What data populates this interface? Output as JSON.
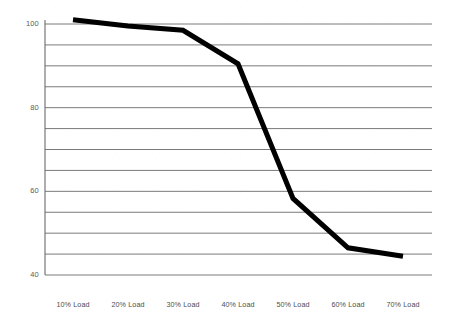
{
  "chart_data": {
    "type": "line",
    "title": "",
    "subtitle": "",
    "xlabel": "",
    "ylabel": "",
    "categories": [
      "10% Load",
      "20% Load",
      "30% Load",
      "40% Load",
      "50% Load",
      "60% Load",
      "70% Load"
    ],
    "series": [
      {
        "name": "",
        "values": [
          101,
          99.5,
          98.5,
          90.5,
          58.3,
          46.5,
          44.5
        ]
      }
    ],
    "ylim": [
      40,
      102
    ],
    "xlim": [
      0,
      8
    ],
    "y_tick_labels": [
      "100",
      "80",
      "60",
      "40"
    ],
    "y_tick_values": [
      100,
      80,
      60,
      40
    ],
    "gridlines": {
      "visible": true,
      "orientation": "horizontal",
      "values": [
        100,
        95,
        90,
        85,
        80,
        75,
        70,
        65,
        60,
        55,
        50,
        45,
        40
      ],
      "color": "#6b6b6b"
    },
    "legend": {
      "visible": false,
      "position": "none",
      "entries": []
    },
    "style": {
      "line_color": "#000000",
      "line_width": 5,
      "background": "#ffffff",
      "axis_color": "#6b6b6b",
      "tick_text_color": "#4e4e4e"
    },
    "axes": {
      "y_axis_visible": true,
      "x_axis_visible": false,
      "top_border": false,
      "right_border": false
    }
  },
  "geometry": {
    "plot_left": 45,
    "plot_right": 432,
    "plot_top": 24,
    "plot_bottom": 275,
    "y_value_top": 100,
    "y_value_bottom": 40,
    "x_label_y": 300,
    "category_x_positions": [
      73,
      128,
      183,
      238,
      293,
      348,
      403
    ]
  },
  "icons": {
    "chart_type": "line-chart-icon"
  }
}
